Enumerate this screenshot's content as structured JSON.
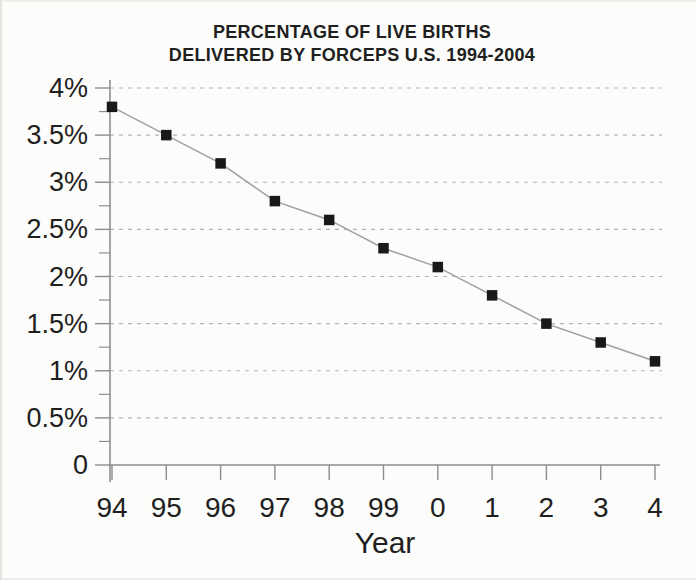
{
  "chart_data": {
    "type": "line",
    "title_line1": "PERCENTAGE OF LIVE BIRTHS",
    "title_line2": "DELIVERED BY FORCEPS U.S. 1994-2004",
    "xlabel": "Year",
    "categories": [
      "94",
      "95",
      "96",
      "97",
      "98",
      "99",
      "0",
      "1",
      "2",
      "3",
      "4"
    ],
    "values": [
      3.8,
      3.5,
      3.2,
      2.8,
      2.6,
      2.3,
      2.1,
      1.8,
      1.5,
      1.3,
      1.1
    ],
    "ylim": [
      0,
      4
    ],
    "y_major_step": 0.5,
    "y_minor_step": 0.25,
    "y_ticks": [
      {
        "value": 4,
        "label": "4%"
      },
      {
        "value": 3.5,
        "label": "3.5%"
      },
      {
        "value": 3,
        "label": "3%"
      },
      {
        "value": 2.5,
        "label": "2.5%"
      },
      {
        "value": 2,
        "label": "2%"
      },
      {
        "value": 1.5,
        "label": "1.5%"
      },
      {
        "value": 1,
        "label": "1%"
      },
      {
        "value": 0.5,
        "label": "0.5%"
      },
      {
        "value": 0,
        "label": "0"
      }
    ],
    "grid": "horizontal-dashed",
    "legend": "none",
    "marker": "filled-square",
    "colors": {
      "text": "#1f1f1f",
      "marker": "#191919",
      "line": "#a0a0a0",
      "axis": "#8e8e8e",
      "grid": "#b4b4b4",
      "background": "#fcfcfa"
    }
  }
}
